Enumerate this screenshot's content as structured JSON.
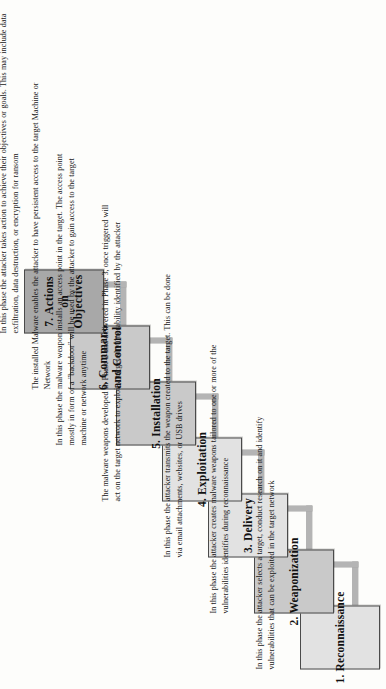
{
  "diagram": {
    "orientation": "rotated-90-ccw staircase",
    "colors": {
      "box_light": "#e2e2e2",
      "box_mid": "#c9c9c9",
      "box_dark": "#a8a8a8",
      "border": "#4a4a4a",
      "connector": "#b4b4b4",
      "text": "#111111",
      "page": "#fdfdfb"
    },
    "stages": [
      {
        "number": "1.",
        "label": "Reconnaissance",
        "fill": "#e2e2e2",
        "description": "In this phase the attacker selects a target, conduct research on it and identify vulnerabilities that can be exploited in the target network"
      },
      {
        "number": "2.",
        "label": "Weaponization",
        "fill": "#c9c9c9",
        "description": "In this phase the attacker creates malware weapons tailored to one or more of the vulnerabilities identifies during reconnaissance"
      },
      {
        "number": "3.",
        "label": "Delivery",
        "fill": "#e2e2e2",
        "description": "In this phase the attacker transmits the weapon created to the target. This can be done via email attachments, websites, or USB drives"
      },
      {
        "number": "4.",
        "label": "Exploitation",
        "fill": "#e2e2e2",
        "description": "The malware weapons developed in Phase 2 and delivered in Phase 3, once triggered will act on the target network to exploit a targeted vulnerability identified by the attacker"
      },
      {
        "number": "5.",
        "label": "Installation",
        "fill": "#c9c9c9",
        "description": "In this phase the malware weapon installs an access point in the target. The access point mostly in form of a \"backdoor\" will be used by the attacker to gain access to the target machine or network anytime"
      },
      {
        "number": "6.",
        "label": "Command and Control",
        "fill": "#c9c9c9",
        "description": "The installed Malware enables the attacker to have persistent access to the target Machine or Network"
      },
      {
        "number": "7.",
        "label": "Actions on Objectives",
        "fill": "#a8a8a8",
        "description": "In this phase the attacker takes action to achieve their objectives or goals. This may include data exfiltration, data destruction, or encryption for ransom"
      }
    ]
  }
}
